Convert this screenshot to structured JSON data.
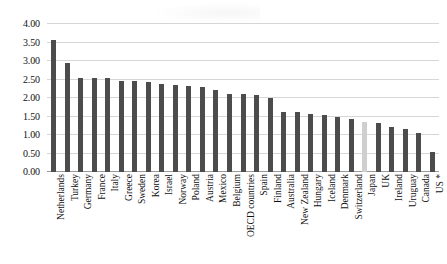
{
  "chart_data": {
    "type": "bar",
    "title": "",
    "subtitle": "",
    "xlabel": "",
    "ylabel": "",
    "ylim": [
      0.0,
      4.0
    ],
    "ytick_labels": [
      "4.00",
      "3.50",
      "3.00",
      "2.50",
      "2.00",
      "1.50",
      "1.00",
      "0.50",
      "0.00"
    ],
    "ytick_values": [
      4.0,
      3.5,
      3.0,
      2.5,
      2.0,
      1.5,
      1.0,
      0.5,
      0.0
    ],
    "grid": true,
    "legend": null,
    "legend_position": "none",
    "highlight_category": "Japan",
    "colors": {
      "bar": "#4c4c4c",
      "bar_highlight": "#cfcfcf",
      "gridline": "#d6d6d6",
      "axis": "#9a9a9a",
      "text": "#111111",
      "background": "#ffffff"
    },
    "categories": [
      "Netherlands",
      "Turkey",
      "Germany",
      "France",
      "Italy",
      "Greece",
      "Sweden",
      "Korea",
      "Israel",
      "Norway",
      "Poland",
      "Austria",
      "Mexico",
      "Belgium",
      "OECD countries",
      "Spain",
      "Finland",
      "Australia",
      "New Zealand",
      "Hungary",
      "Iceland",
      "Denmark",
      "Switzerland",
      "Japan",
      "UK",
      "Ireland",
      "Uruguay",
      "Canada",
      "US *"
    ],
    "values": [
      3.57,
      2.95,
      2.55,
      2.53,
      2.53,
      2.45,
      2.45,
      2.42,
      2.38,
      2.36,
      2.33,
      2.31,
      2.21,
      2.11,
      2.1,
      2.09,
      2.0,
      1.63,
      1.61,
      1.56,
      1.53,
      1.5,
      1.42,
      1.35,
      1.33,
      1.23,
      1.15,
      1.06,
      0.55
    ]
  },
  "footnote": ""
}
